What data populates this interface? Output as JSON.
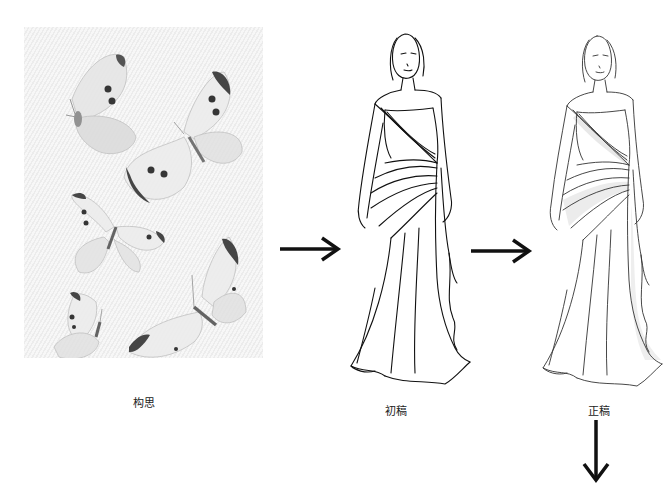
{
  "process": {
    "steps": [
      {
        "label": "构思",
        "kind": "inspiration-photo",
        "subject": "butterflies"
      },
      {
        "label": "初稿",
        "kind": "first-draft-sketch",
        "subject": "evening gown"
      },
      {
        "label": "正稿",
        "kind": "final-draft-sketch",
        "subject": "evening gown"
      }
    ],
    "arrows": [
      {
        "direction": "right",
        "from": "构思",
        "to": "初稿"
      },
      {
        "direction": "right",
        "from": "初稿",
        "to": "正稿"
      },
      {
        "direction": "down",
        "from": "正稿",
        "to": ""
      }
    ]
  },
  "colors": {
    "background": "#ffffff",
    "ink": "#111111",
    "photo_bg": "#f0f0f0",
    "wing_spot": "#222222"
  }
}
